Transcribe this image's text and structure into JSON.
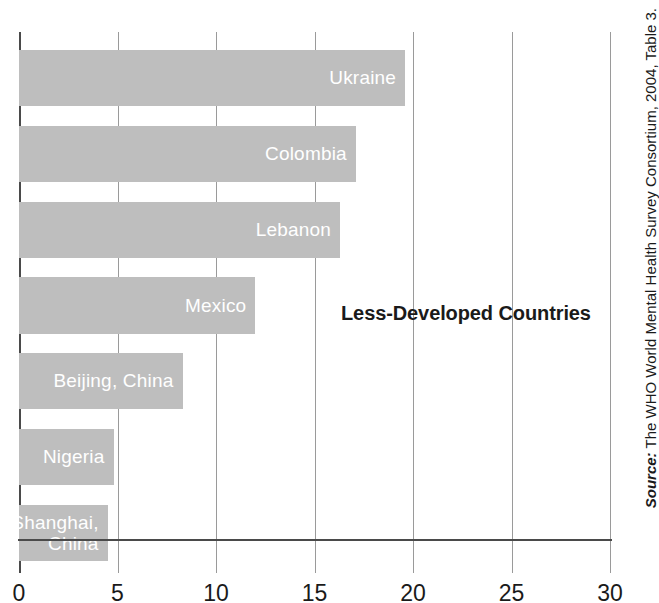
{
  "chart_data": {
    "type": "bar",
    "orientation": "horizontal",
    "title": "",
    "annotation": "Less-Developed Countries",
    "categories": [
      "Ukraine",
      "Colombia",
      "Lebanon",
      "Mexico",
      "Beijing, China",
      "Nigeria",
      "Shanghai,\nChina"
    ],
    "values": [
      19.6,
      17.1,
      16.3,
      12.0,
      8.3,
      4.8,
      4.5
    ],
    "xlabel": "",
    "ylabel": "",
    "xlim": [
      0,
      30
    ],
    "xticks": [
      0,
      5,
      10,
      15,
      20,
      25,
      30
    ],
    "xtick_labels": [
      "0",
      "5",
      "10",
      "15",
      "20",
      "25",
      "30"
    ],
    "grid": true,
    "grid_axis": "x",
    "legend": "none",
    "bar_color": "#bebebe",
    "bar_label_color": "#ffffff",
    "axis_color": "#4a4a4a",
    "gridline_color": "#9a9a9a"
  },
  "source": {
    "prefix": "Source:",
    "text": " The WHO World Mental Health Survey Consortium, 2004, Table 3."
  }
}
